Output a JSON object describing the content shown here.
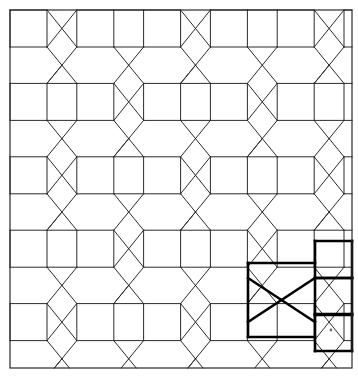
{
  "figure": {
    "canvas": {
      "width": 358,
      "height": 376,
      "background": "#ffffff"
    },
    "border": {
      "x": 10,
      "y": 10,
      "width": 342,
      "height": 358,
      "color": "#2b2b2b",
      "stroke_width": 1.2
    }
  },
  "style": {
    "line_color": "#2b2b2b",
    "line_width": 1,
    "bold_color": "#000000",
    "bold_width": 2.6,
    "mark_color": "#6e6e6e"
  },
  "geometry": {
    "origin_x": 10,
    "origin_y": 10,
    "period_x": 66.8,
    "period_y": 73.4,
    "square_size": 37,
    "columns": 6,
    "rows": 5,
    "notes": "Squares sit on a rectangular lattice; elongated hexagons fill the gaps; diagonal edges cross to form X motifs in alternating cells."
  },
  "chart_data": {
    "type": "diagram",
    "square_columns_x": [
      10,
      76.8,
      143.6,
      210.4,
      277.2,
      344.0
    ],
    "square_rows_y": [
      10,
      83.4,
      156.8,
      230.2,
      303.6
    ],
    "square_side": 37,
    "tile_kinds": [
      "square",
      "elongated-hexagon"
    ],
    "highlight": {
      "label": "repeating unit",
      "bold": true,
      "hexagon_cell": {
        "x": 248,
        "y": 263,
        "width": 67,
        "height": 74
      },
      "square_stack": [
        {
          "x": 315,
          "y": 241,
          "width": 37,
          "height": 37
        },
        {
          "x": 315,
          "y": 278,
          "width": 37,
          "height": 37
        },
        {
          "x": 315,
          "y": 314,
          "width": 37,
          "height": 37
        }
      ],
      "has_internal_cross": true,
      "mark_dot": {
        "x": 331,
        "y": 330,
        "r": 1.4
      }
    }
  }
}
